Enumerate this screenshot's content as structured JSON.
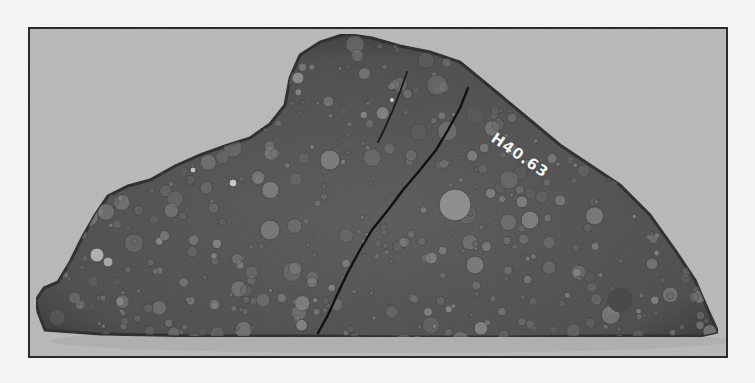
{
  "image": {
    "subject": "meteorite-slab",
    "description": "Cut slab of a chondritic meteorite with visible chondrules and a crack, photographed on a gray background inside a black frame",
    "specimen_label": "H40.63",
    "colors": {
      "page_background": "#f4f4f4",
      "frame_border": "#2a2a2a",
      "photo_background": "#bcbcbc",
      "rock_base": "#5a5a5a",
      "rock_dark": "#3e3e3e",
      "chondrule_light": "#8a8a8a",
      "crack": "#111111",
      "label_text": "#f2f2f2"
    }
  }
}
